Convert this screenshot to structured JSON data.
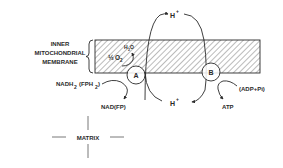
{
  "diagram": {
    "membrane_label": {
      "line1": "INNER",
      "line2": "MITOCHONDRIAL",
      "line3": "MEMBRANE"
    },
    "proton_top": "H",
    "proton_top_charge": "+",
    "proton_bottom": "H",
    "proton_bottom_charge": "+",
    "complex_a": "A",
    "complex_b": "B",
    "water": "H",
    "water_sub": "2",
    "water_o": "O",
    "oxygen_frac": "½",
    "oxygen": "O",
    "oxygen_sub": "2",
    "nadh_main": "NADH",
    "nadh_sub": "2",
    "nadh_paren": "(FPH",
    "nadh_paren_sub": "2",
    "nadh_close": ")",
    "nad": "NAD(FP)",
    "adp": "(ADP+Pi)",
    "atp": "ATP",
    "matrix": "MATRIX"
  },
  "colors": {
    "ink": "#2a2a2a",
    "background": "#ffffff"
  }
}
